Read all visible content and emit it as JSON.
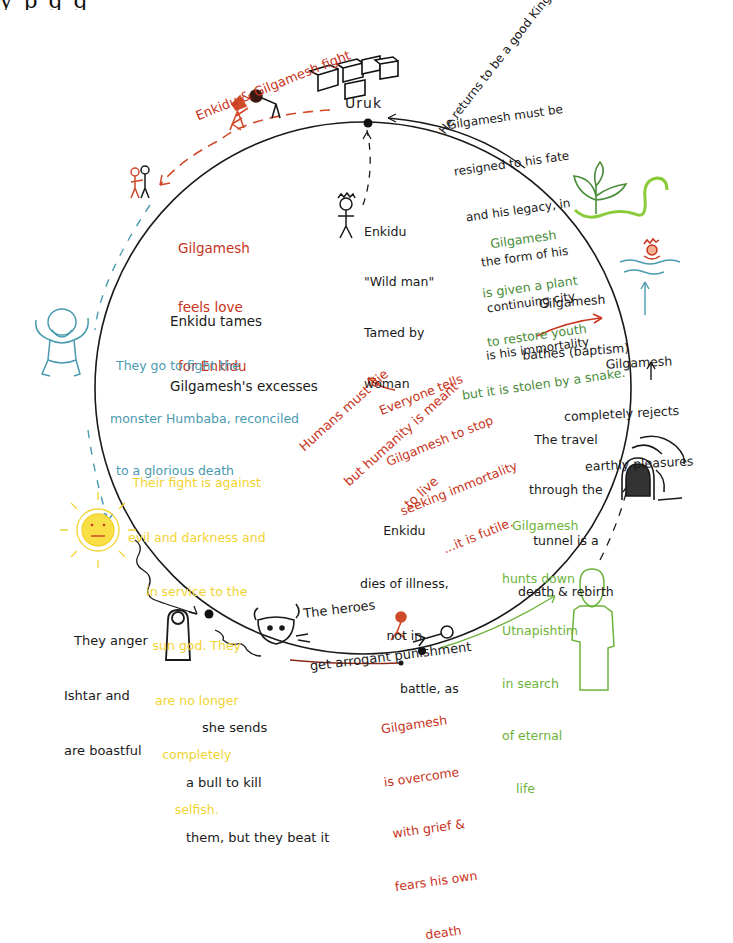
{
  "title_strip": "y         p           g                             g",
  "colors": {
    "black": "#1a1a1a",
    "red": "#c8341c",
    "green": "#4a8c3a",
    "light_green": "#6cb33a",
    "blue": "#4a9ab0",
    "yellow": "#f2d330"
  },
  "diagram": {
    "type": "hero-journey-cycle",
    "nodes": {
      "uruk": "Uruk",
      "returns_king": "He returns to be a good King",
      "enkidu_gilgamesh_fight": "Enkidu & Gilgamesh fight",
      "resigned": [
        "Gilgamesh must be",
        "resigned to his fate",
        "and his legacy, in",
        "the form of his",
        "continuing city",
        "is his immortality"
      ],
      "wild_man": [
        "Enkidu",
        "\"Wild man\"",
        "Tamed by",
        "woman"
      ],
      "feels_love": [
        "Gilgamesh",
        "feels love",
        "for Enkidu"
      ],
      "tames_excesses": [
        "Enkidu tames",
        "Gilgamesh's excesses"
      ],
      "plant": [
        "Gilgamesh",
        "is given a plant",
        "to restore youth",
        "but it is stolen by a snake."
      ],
      "bathes": [
        "Gilgamesh",
        "bathes (baptism)"
      ],
      "humbaba": [
        "They go to fight the",
        "monster Humbaba, reconciled",
        "to a glorious death"
      ],
      "humans_must_die": [
        "Humans must die",
        "but humanity is meant",
        "to live"
      ],
      "everyone_tells": [
        "Everyone tells",
        "Gilgamesh to stop",
        "seeking immortality",
        "...it is futile."
      ],
      "rejects": [
        "Gilgamesh",
        "completely rejects",
        "earthly pleasures"
      ],
      "tunnel": [
        "The travel",
        "through the",
        "tunnel is a",
        "death & rebirth"
      ],
      "sun_god": [
        "Their fight is against",
        "evil and darkness and",
        "in service to the",
        "sun god. They",
        "are no longer",
        "completely",
        "selfish."
      ],
      "enkidu_dies": [
        "Enkidu",
        "dies of illness,",
        "not in",
        "battle, as"
      ],
      "arrogant": [
        "The heroes",
        "get arrogant punishment"
      ],
      "utnapishtim": [
        "Gilgamesh",
        "hunts down",
        "Utnapishtim",
        "in search",
        "of eternal",
        "life"
      ],
      "anger_ishtar": [
        "They anger",
        "Ishtar and",
        "are boastful"
      ],
      "bull": [
        "she sends",
        "a bull to kill",
        "them, but they beat it"
      ],
      "grief": [
        "Gilgamesh",
        "is overcome",
        "with grief &",
        "fears his own",
        "death"
      ]
    },
    "icons": [
      "city-blocks-icon",
      "fighting-figures-icon",
      "embracing-figures-icon",
      "wild-man-icon",
      "humbaba-icon",
      "sun-icon",
      "ishtar-icon",
      "bull-icon",
      "dying-enkidu-icon",
      "utnapishtim-icon",
      "tunnel-icon",
      "bathing-figure-icon",
      "plant-snake-icon"
    ]
  }
}
